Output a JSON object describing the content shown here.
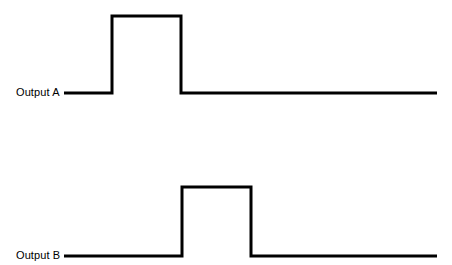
{
  "figure": {
    "type": "timing-diagram",
    "background_color": "#ffffff",
    "stroke_color": "#000000",
    "stroke_width": 3,
    "width": 452,
    "height": 265
  },
  "traces": [
    {
      "id": "output-a",
      "label": "Output A",
      "label_x": 16,
      "label_y": 96,
      "baseline_y": 93,
      "high_y": 16,
      "line_start_x": 64,
      "line_end_x": 437,
      "rise_x": 112,
      "fall_x": 181,
      "path": "M 64 93 L 112 93 L 112 16 L 181 16 L 181 93 L 437 93"
    },
    {
      "id": "output-b",
      "label": "Output B",
      "label_x": 16,
      "label_y": 259,
      "baseline_y": 256,
      "high_y": 187,
      "line_start_x": 64,
      "line_end_x": 437,
      "rise_x": 182,
      "fall_x": 251,
      "path": "M 64 256 L 182 256 L 182 187 L 251 187 L 251 256 L 437 256"
    }
  ],
  "chart_data": {
    "type": "line",
    "title": "",
    "xlabel": "",
    "ylabel": "",
    "series": [
      {
        "name": "Output A",
        "points": [
          {
            "x": 64,
            "level": 0
          },
          {
            "x": 112,
            "level": 0
          },
          {
            "x": 112,
            "level": 1
          },
          {
            "x": 181,
            "level": 1
          },
          {
            "x": 181,
            "level": 0
          },
          {
            "x": 437,
            "level": 0
          }
        ],
        "pulse_start_x": 112,
        "pulse_end_x": 181,
        "pulse_width_px": 69
      },
      {
        "name": "Output B",
        "points": [
          {
            "x": 64,
            "level": 0
          },
          {
            "x": 182,
            "level": 0
          },
          {
            "x": 182,
            "level": 1
          },
          {
            "x": 251,
            "level": 1
          },
          {
            "x": 251,
            "level": 0
          },
          {
            "x": 437,
            "level": 0
          }
        ],
        "pulse_start_x": 182,
        "pulse_end_x": 251,
        "pulse_width_px": 69
      }
    ],
    "legend": [
      "Output A",
      "Output B"
    ],
    "grid": false,
    "legend_position": "inline-left"
  }
}
